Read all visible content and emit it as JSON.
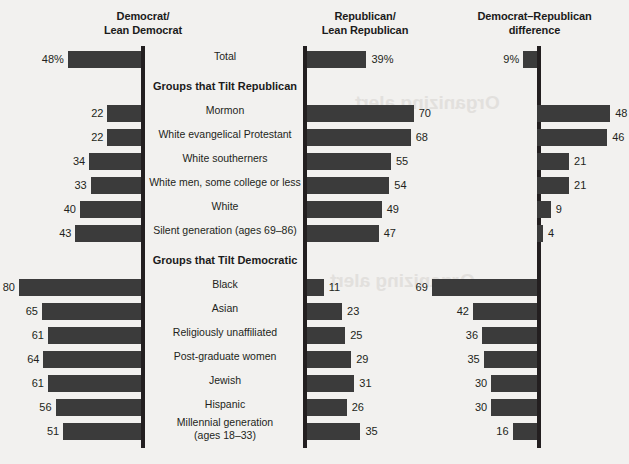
{
  "headers": {
    "dem": "Democrat/\nLean Democrat",
    "dem_l1": "Democrat/",
    "dem_l2": "Lean Democrat",
    "rep_l1": "Republican/",
    "rep_l2": "Lean Republican",
    "diff_l1": "Democrat–Republican",
    "diff_l2": "difference"
  },
  "sections": {
    "republican_tilt": "Groups that Tilt Republican",
    "democratic_tilt": "Groups that Tilt Democratic"
  },
  "ghost_text": {
    "a": "Organizing alert",
    "b": "Organizing alert",
    "c": "Headline or Here in the"
  },
  "chart_data": {
    "type": "bar",
    "xlabel": "",
    "ylabel": "",
    "series": [
      {
        "name": "Democrat/Lean Democrat",
        "axis": "left",
        "direction": "left"
      },
      {
        "name": "Republican/Lean Republican",
        "axis": "center",
        "direction": "right"
      },
      {
        "name": "Democrat–Republican difference",
        "axis": "right",
        "direction": "signed"
      }
    ],
    "scale_units_per_100": 100,
    "rows": [
      {
        "label": "Total",
        "dem": 48,
        "rep": 39,
        "diff": 9,
        "dem_text": "48%",
        "rep_text": "39%",
        "diff_text": "9%",
        "diff_lead": "D",
        "group": "total"
      },
      {
        "label": "Mormon",
        "dem": 22,
        "rep": 70,
        "diff": 48,
        "dem_text": "22",
        "rep_text": "70",
        "diff_text": "48",
        "diff_lead": "R",
        "group": "republican_tilt"
      },
      {
        "label": "White evangelical Protestant",
        "dem": 22,
        "rep": 68,
        "diff": 46,
        "dem_text": "22",
        "rep_text": "68",
        "diff_text": "46",
        "diff_lead": "R",
        "group": "republican_tilt"
      },
      {
        "label": "White southerners",
        "dem": 34,
        "rep": 55,
        "diff": 21,
        "dem_text": "34",
        "rep_text": "55",
        "diff_text": "21",
        "diff_lead": "R",
        "group": "republican_tilt"
      },
      {
        "label": "White men, some college or less",
        "dem": 33,
        "rep": 54,
        "diff": 21,
        "dem_text": "33",
        "rep_text": "54",
        "diff_text": "21",
        "diff_lead": "R",
        "group": "republican_tilt"
      },
      {
        "label": "White",
        "dem": 40,
        "rep": 49,
        "diff": 9,
        "dem_text": "40",
        "rep_text": "49",
        "diff_text": "9",
        "diff_lead": "R",
        "group": "republican_tilt"
      },
      {
        "label": "Silent generation (ages 69–86)",
        "dem": 43,
        "rep": 47,
        "diff": 4,
        "dem_text": "43",
        "rep_text": "47",
        "diff_text": "4",
        "diff_lead": "R",
        "group": "republican_tilt"
      },
      {
        "label": "Black",
        "dem": 80,
        "rep": 11,
        "diff": 69,
        "dem_text": "80",
        "rep_text": "11",
        "diff_text": "69",
        "diff_lead": "D",
        "group": "democratic_tilt"
      },
      {
        "label": "Asian",
        "dem": 65,
        "rep": 23,
        "diff": 42,
        "dem_text": "65",
        "rep_text": "23",
        "diff_text": "42",
        "diff_lead": "D",
        "group": "democratic_tilt"
      },
      {
        "label": "Religiously unaffiliated",
        "dem": 61,
        "rep": 25,
        "diff": 36,
        "dem_text": "61",
        "rep_text": "25",
        "diff_text": "36",
        "diff_lead": "D",
        "group": "democratic_tilt"
      },
      {
        "label": "Post-graduate women",
        "dem": 64,
        "rep": 29,
        "diff": 35,
        "dem_text": "64",
        "rep_text": "29",
        "diff_text": "35",
        "diff_lead": "D",
        "group": "democratic_tilt"
      },
      {
        "label": "Jewish",
        "dem": 61,
        "rep": 31,
        "diff": 30,
        "dem_text": "61",
        "rep_text": "31",
        "diff_text": "30",
        "diff_lead": "D",
        "group": "democratic_tilt"
      },
      {
        "label": "Hispanic",
        "dem": 56,
        "rep": 26,
        "diff": 30,
        "dem_text": "56",
        "rep_text": "26",
        "diff_text": "30",
        "diff_lead": "D",
        "group": "democratic_tilt"
      },
      {
        "label": "Millennial generation\n(ages 18–33)",
        "label_l1": "Millennial generation",
        "label_l2": "(ages 18–33)",
        "dem": 51,
        "rep": 35,
        "diff": 16,
        "dem_text": "51",
        "rep_text": "35",
        "diff_text": "16",
        "diff_lead": "D",
        "group": "democratic_tilt"
      }
    ],
    "colors": {
      "bar": "#3b3b3b",
      "axis": "#231f20",
      "background": "#f2f1ef",
      "text": "#231f20"
    }
  }
}
